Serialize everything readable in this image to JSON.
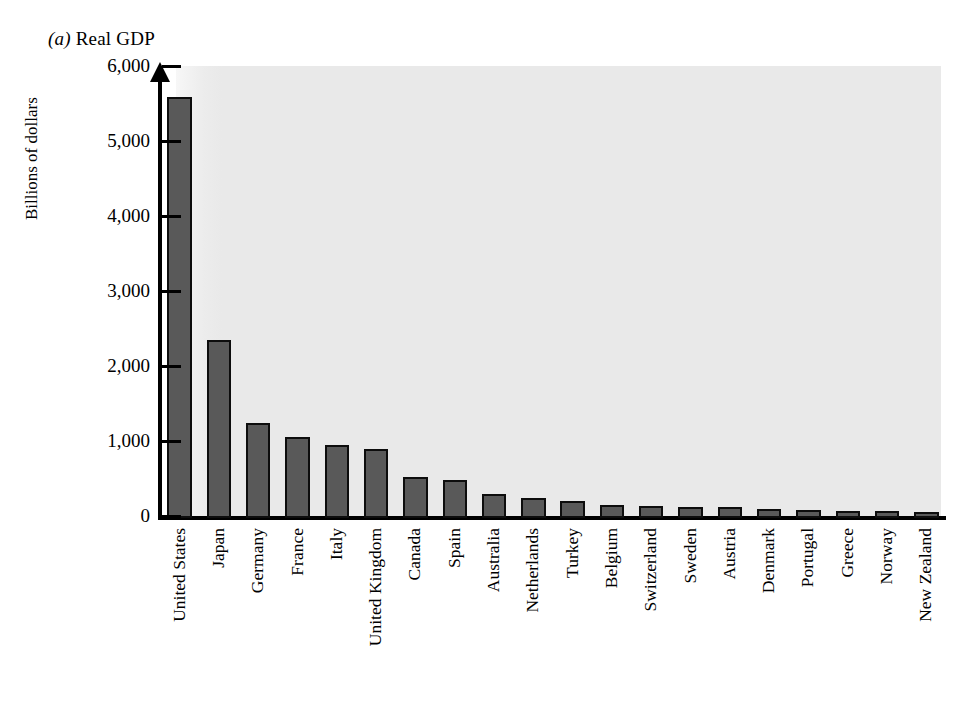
{
  "figure": {
    "panel_letter": "a",
    "panel_title": "Real GDP",
    "title_full": "(a) Real GDP"
  },
  "axes": {
    "y_axis_title": "Billions of dollars",
    "y_ticks": [
      "6,000",
      "5,000",
      "4,000",
      "3,000",
      "2,000",
      "1,000",
      "0"
    ],
    "y_min": 0,
    "y_max": 6000,
    "y_step": 1000,
    "x_axis_title": ""
  },
  "colors": {
    "bar_fill": "#595959",
    "bar_border": "#0d0d0d",
    "plot_background": "#e9e9e9",
    "axis": "#000000",
    "text": "#000000",
    "page_background": "#ffffff"
  },
  "chart_data": {
    "type": "bar",
    "title": "(a) Real GDP",
    "xlabel": "",
    "ylabel": "Billions of dollars",
    "ylim": [
      0,
      6000
    ],
    "ytick_values": [
      0,
      1000,
      2000,
      3000,
      4000,
      5000,
      6000
    ],
    "grid": false,
    "legend": false,
    "units": "Billions of dollars",
    "categories": [
      "United States",
      "Japan",
      "Germany",
      "France",
      "Italy",
      "United Kingdom",
      "Canada",
      "Spain",
      "Australia",
      "Netherlands",
      "Turkey",
      "Belgium",
      "Switzerland",
      "Sweden",
      "Austria",
      "Denmark",
      "Portugal",
      "Greece",
      "Norway",
      "New Zealand"
    ],
    "values": [
      5610,
      2380,
      1265,
      1080,
      975,
      925,
      545,
      505,
      320,
      270,
      225,
      175,
      155,
      150,
      145,
      120,
      110,
      100,
      100,
      85
    ]
  }
}
